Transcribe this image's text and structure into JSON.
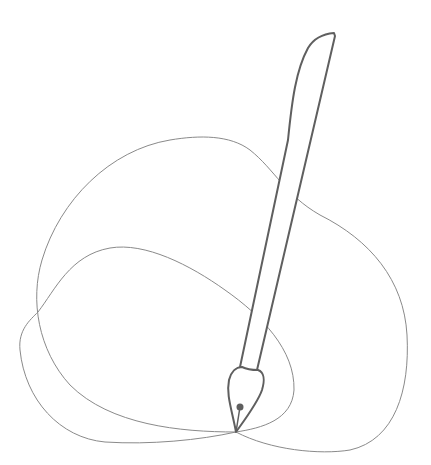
{
  "illustration": {
    "title": "Pen tool drawing lasso curves",
    "colors": {
      "background": "#ffffff",
      "pen_stroke": "#5f5f5f",
      "curve_stroke": "#8a8a8a"
    },
    "elements": [
      "pen-nib",
      "pen-body",
      "outer-loop-curve",
      "inner-loop-curve"
    ]
  }
}
